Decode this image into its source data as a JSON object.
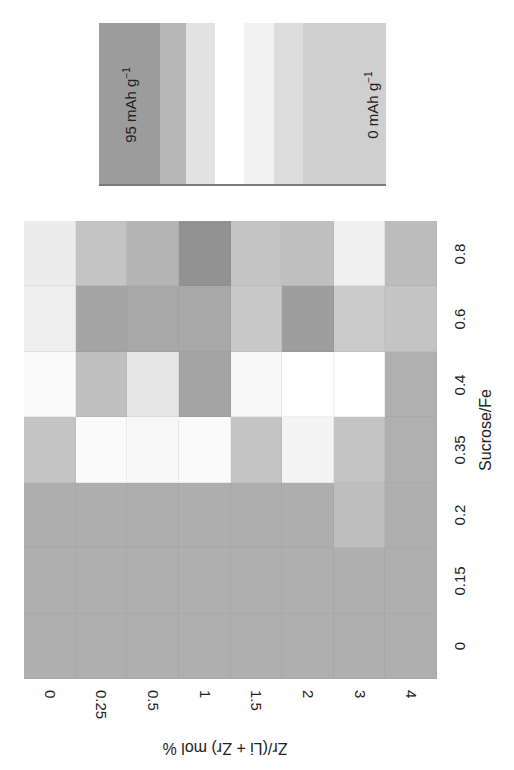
{
  "chart_data": {
    "type": "heatmap",
    "title": "",
    "orientation_note": "figure printed rotated: Sucrose/Fe axis on right (rotated 90° CCW), Zr axis on bottom (rotated)",
    "xlabel": "Zr/(Li + Zr) mol %",
    "ylabel": "Sucrose/Fe",
    "x_categories": [
      "0",
      "0.25",
      "0.5",
      "1",
      "1.5",
      "2",
      "3",
      "4"
    ],
    "y_categories_top_to_bottom": [
      "0.8",
      "0.6",
      "0.4",
      "0.35",
      "0.2",
      "0.15",
      "0"
    ],
    "colorbar": {
      "min_label": "0 mAh g",
      "max_label": "95 mAh g",
      "unit_superscript": "−1",
      "bands_left_to_right": [
        {
          "color": "#9c9c9c",
          "width": 61
        },
        {
          "color": "#b8b8b8",
          "width": 26
        },
        {
          "color": "#e2e2e2",
          "width": 29
        },
        {
          "color": "#ffffff",
          "width": 29
        },
        {
          "color": "#f2f2f2",
          "width": 30
        },
        {
          "color": "#dddddd",
          "width": 29
        },
        {
          "color": "#cfcfcf",
          "width": 83
        }
      ]
    },
    "cell_colors": [
      [
        "#ececec",
        "#c4c4c4",
        "#b4b4b4",
        "#929292",
        "#c4c4c4",
        "#c0c0c0",
        "#f0f0f0",
        "#bcbcbc"
      ],
      [
        "#eeeeee",
        "#a4a4a4",
        "#a8a8a8",
        "#a8a8a8",
        "#c8c8c8",
        "#9e9e9e",
        "#cacaca",
        "#c4c4c4"
      ],
      [
        "#fafafa",
        "#c0c0c0",
        "#e6e6e6",
        "#a4a4a4",
        "#f8f8f8",
        "#ffffff",
        "#ffffff",
        "#b0b0b0"
      ],
      [
        "#c4c4c4",
        "#fafafa",
        "#f8f8f8",
        "#fafafa",
        "#c4c4c4",
        "#f4f4f4",
        "#c4c4c4",
        "#b0b0b0"
      ],
      [
        "#aeaeae",
        "#aeaeae",
        "#aeaeae",
        "#aeaeae",
        "#aeaeae",
        "#aeaeae",
        "#bebebe",
        "#afafaf"
      ],
      [
        "#afafaf",
        "#afafaf",
        "#afafaf",
        "#afafaf",
        "#afafaf",
        "#afafaf",
        "#afafaf",
        "#afafaf"
      ],
      [
        "#afafaf",
        "#afafaf",
        "#afafaf",
        "#afafaf",
        "#afafaf",
        "#afafaf",
        "#afafaf",
        "#afafaf"
      ]
    ]
  },
  "legend": {
    "max_text": "95 mAh g",
    "min_text": "0 mAh g",
    "sup": "−1"
  }
}
